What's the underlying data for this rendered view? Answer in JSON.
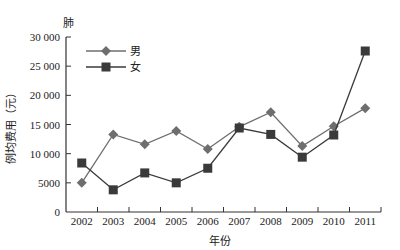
{
  "chart_data": {
    "type": "line",
    "title": "",
    "corner_label": "肺",
    "xlabel": "年份",
    "ylabel": "例均费用（元）",
    "categories": [
      "2002",
      "2003",
      "2004",
      "2005",
      "2006",
      "2007",
      "2008",
      "2009",
      "2010",
      "2011"
    ],
    "series": [
      {
        "name": "男",
        "marker": "diamond",
        "color": "#6e6e6e",
        "values": [
          5000,
          13300,
          11600,
          13900,
          10800,
          14600,
          17100,
          11300,
          14700,
          17800
        ]
      },
      {
        "name": "女",
        "marker": "square",
        "color": "#3a3a3a",
        "values": [
          8400,
          3800,
          6700,
          5000,
          7500,
          14400,
          13300,
          9400,
          13200,
          27600
        ]
      }
    ],
    "ylim": [
      0,
      30000
    ],
    "yticks": [
      0,
      5000,
      10000,
      15000,
      20000,
      25000,
      30000
    ],
    "ytick_labels": [
      "0",
      "5000",
      "10 000",
      "15 000",
      "20 000",
      "25 000",
      "30 000"
    ],
    "grid": false,
    "legend_position": "upper-left"
  }
}
